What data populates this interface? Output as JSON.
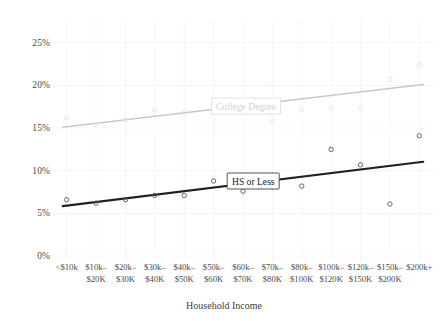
{
  "chart_data": {
    "type": "scatter",
    "title": "",
    "xlabel": "Household Income",
    "ylabel": "",
    "ylim": [
      0,
      26.5
    ],
    "yticks": [
      0,
      5,
      10,
      15,
      20,
      25
    ],
    "ytick_labels": [
      "0%",
      "5%",
      "10%",
      "15%",
      "20%",
      "25%"
    ],
    "grid": true,
    "legend_position": "inline-labels",
    "categories": [
      "<$10k",
      "$10k–|$20K",
      "$20k–|$30K",
      "$30k–|$40K",
      "$40k–|$50K",
      "$50k–|$60K",
      "$60k–|$70K",
      "$70k–|$80K",
      "$80k–|$100K",
      "$100k–|$120K",
      "$120k–|$150K",
      "$150k–|$200K",
      "$200k+"
    ],
    "series": [
      {
        "name": "College Degree",
        "color": "#c8c8c8",
        "label_x_index": 6.1,
        "label_y": 17.6,
        "points": [
          16.2,
          15.4,
          15.9,
          17.1,
          16.8,
          16.9,
          16.9,
          15.8,
          17.2,
          17.4,
          17.4,
          20.7,
          22.4
        ],
        "fit_start": 15.1,
        "fit_end": 20.1
      },
      {
        "name": "HS or Less",
        "color": "#1f1f1f",
        "label_x_index": 6.35,
        "label_y": 8.85,
        "points": [
          6.6,
          6.2,
          6.6,
          7.1,
          7.1,
          8.8,
          7.6,
          8.1,
          8.2,
          12.5,
          10.7,
          6.1,
          14.1
        ],
        "fit_start": 5.85,
        "fit_end": 11.05
      }
    ]
  },
  "plot": {
    "left": 52,
    "right": 434,
    "top": 30,
    "bottom": 256
  }
}
